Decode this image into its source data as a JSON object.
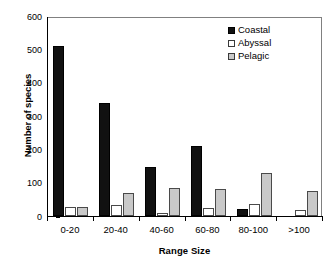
{
  "chart_data": {
    "type": "bar",
    "title": "",
    "xlabel": "Range Size",
    "ylabel": "Number of species",
    "categories": [
      "0-20",
      "20-40",
      "40-60",
      "60-80",
      "80-100",
      ">100"
    ],
    "series": [
      {
        "name": "Coastal",
        "color": "#111111",
        "values": [
          510,
          340,
          147,
          210,
          22,
          0
        ]
      },
      {
        "name": "Abyssal",
        "color": "#ffffff",
        "values": [
          26,
          32,
          10,
          23,
          36,
          19
        ]
      },
      {
        "name": "Pelagic",
        "color": "#c9c9c9",
        "values": [
          26,
          70,
          83,
          80,
          128,
          76
        ]
      }
    ],
    "ylim": [
      0,
      600
    ],
    "yticks": [
      0,
      100,
      200,
      300,
      400,
      500,
      600
    ],
    "ytick_labels": [
      "0",
      "100",
      "200",
      "300",
      "400",
      "500",
      "600"
    ],
    "grid": false,
    "legend_position": "top-right"
  },
  "legend": {
    "items": [
      {
        "label": "Coastal",
        "swatch": "filled-black-square-icon"
      },
      {
        "label": "Abyssal",
        "swatch": "empty-white-square-icon"
      },
      {
        "label": "Pelagic",
        "swatch": "gray-square-icon"
      }
    ]
  }
}
